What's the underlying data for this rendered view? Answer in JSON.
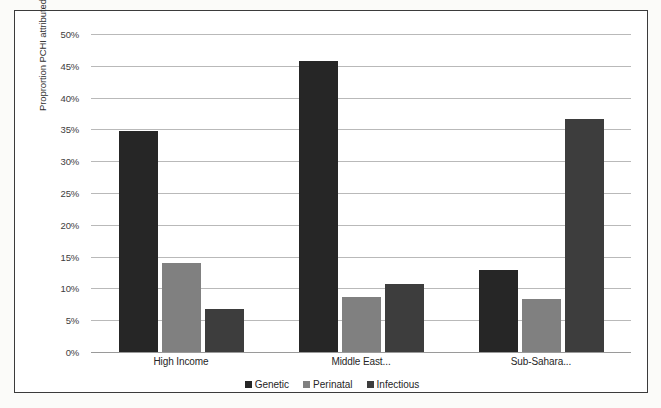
{
  "chart_data": {
    "type": "bar",
    "title": "",
    "xlabel": "",
    "ylabel": "Proprortion PCHI attributed",
    "categories": [
      "High Income",
      "Middle East...",
      "Sub-Sahara..."
    ],
    "series": [
      {
        "name": "Genetic",
        "color": "#262626",
        "values": [
          34.8,
          45.8,
          12.9
        ]
      },
      {
        "name": "Perinatal",
        "color": "#808080",
        "values": [
          14.0,
          8.6,
          8.4
        ]
      },
      {
        "name": "Infectious",
        "color": "#3d3d3d",
        "values": [
          6.7,
          10.7,
          36.6
        ]
      }
    ],
    "ylim": [
      0,
      50
    ],
    "ytick_labels": [
      "50%",
      "45%",
      "40%",
      "35%",
      "30%",
      "25%",
      "20%",
      "15%",
      "10%",
      "5%",
      "0%"
    ],
    "ytick_values": [
      50,
      45,
      40,
      35,
      30,
      25,
      20,
      15,
      10,
      5,
      0
    ],
    "grid": true,
    "legend_position": "bottom",
    "value_suffix": "%"
  },
  "axis": {
    "y_title": "Proprortion PCHI attributed"
  },
  "legend": {
    "items": [
      {
        "label": "Genetic",
        "color": "#262626"
      },
      {
        "label": "Perinatal",
        "color": "#808080"
      },
      {
        "label": "Infectious",
        "color": "#3d3d3d"
      }
    ]
  }
}
